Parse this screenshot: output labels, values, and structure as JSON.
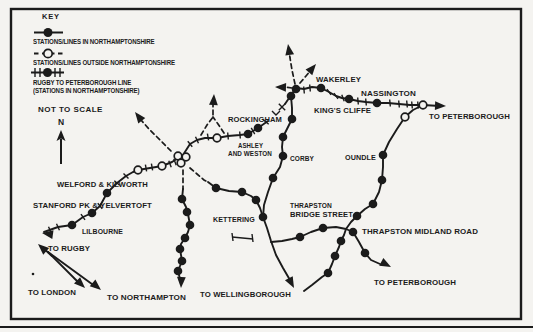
{
  "colors": {
    "ink": "#1b1b1b",
    "paper": "#f4f3f0"
  },
  "key": {
    "title": "KEY",
    "items": [
      {
        "symbol": "filled-station-on-solid-line",
        "label": "STATIONS/LINES IN NORTHAMPTONSHIRE"
      },
      {
        "symbol": "open-station-on-dashed-line",
        "label": "STATIONS/LINES OUTSIDE NORTHAMPTONSHIRE"
      },
      {
        "symbol": "filled-station-on-cross-ticked-line",
        "label": "RUGBY TO PETERBOROUGH LINE",
        "label2": "(STATIONS IN NORTHAMPTONSHIRE)"
      }
    ],
    "not_to_scale": "NOT TO SCALE",
    "north_label": "N"
  },
  "map": {
    "frame": {
      "x": 11,
      "y": 9,
      "w": 510,
      "h": 310,
      "stroke_w": 2.4
    },
    "page_bottom_line": {
      "y": 327
    },
    "labels": [
      {
        "id": "wakerley",
        "text": "WAKERLEY",
        "x": 316,
        "y": 82,
        "w": 45
      },
      {
        "id": "kings-cliffe",
        "text": "KING'S CLIFFE",
        "x": 314,
        "y": 113,
        "w": 57
      },
      {
        "id": "nassington",
        "text": "NASSINGTON",
        "x": 361,
        "y": 96,
        "w": 55
      },
      {
        "id": "to-peterborough-top",
        "text": "TO PETERBOROUGH",
        "x": 429,
        "y": 119,
        "w": 81
      },
      {
        "id": "rockingham",
        "text": "ROCKINGHAM",
        "x": 228,
        "y": 122,
        "w": 54
      },
      {
        "id": "ashley-line1",
        "text": "ASHLEY",
        "x": 238,
        "y": 148,
        "w": 25
      },
      {
        "id": "ashley-line2",
        "text": "AND WESTON",
        "x": 228,
        "y": 156,
        "w": 44
      },
      {
        "id": "corby",
        "text": "CORBY",
        "x": 290,
        "y": 161,
        "w": 24
      },
      {
        "id": "oundle",
        "text": "OUNDLE",
        "x": 345,
        "y": 160,
        "w": 31
      },
      {
        "id": "kettering",
        "text": "KETTERING",
        "x": 213,
        "y": 222,
        "w": 42
      },
      {
        "id": "thrapston-bs-line1",
        "text": "THRAPSTON",
        "x": 290,
        "y": 208,
        "w": 42
      },
      {
        "id": "thrapston-bs-line2",
        "text": "BRIDGE STREET",
        "x": 290,
        "y": 217,
        "w": 63
      },
      {
        "id": "thrapston-midland",
        "text": "THRAPSTON MIDLAND ROAD",
        "x": 362,
        "y": 234,
        "w": 116
      },
      {
        "id": "to-peterborough-bottom",
        "text": "TO PETERBOROUGH",
        "x": 374,
        "y": 285,
        "w": 82
      },
      {
        "id": "to-wellingborough",
        "text": "TO WELLINGBOROUGH",
        "x": 200,
        "y": 297,
        "w": 91
      },
      {
        "id": "to-northampton",
        "text": "TO NORTHAMPTON",
        "x": 107,
        "y": 300,
        "w": 79
      },
      {
        "id": "to-london",
        "text": "TO LONDON",
        "x": 28,
        "y": 295,
        "w": 48
      },
      {
        "id": "to-rugby",
        "text": "TO RUGBY",
        "x": 48,
        "y": 251,
        "w": 42
      },
      {
        "id": "lilbourne",
        "text": "LILBOURNE",
        "x": 82,
        "y": 234,
        "w": 41
      },
      {
        "id": "stanford-pk",
        "text": "STANFORD PK & YELVERTOFT",
        "x": 33,
        "y": 208,
        "w": 119
      },
      {
        "id": "welford",
        "text": "WELFORD & KILWORTH",
        "x": 57,
        "y": 187,
        "w": 91
      }
    ],
    "solid_paths": [
      [
        [
          44,
          232
        ],
        [
          58,
          227
        ],
        [
          72,
          225
        ],
        [
          83,
          217
        ],
        [
          92,
          213
        ],
        [
          100,
          206
        ],
        [
          107,
          193
        ],
        [
          117,
          183
        ],
        [
          126,
          176
        ],
        [
          133,
          172
        ],
        [
          138,
          170
        ],
        [
          150,
          168
        ],
        [
          162,
          166
        ],
        [
          172,
          162
        ],
        [
          178,
          158
        ]
      ],
      [
        [
          183,
          155
        ],
        [
          190,
          144
        ],
        [
          197,
          140
        ],
        [
          205,
          138
        ],
        [
          217,
          138
        ],
        [
          228,
          136
        ],
        [
          240,
          135
        ],
        [
          248,
          134
        ],
        [
          253,
          131
        ],
        [
          258,
          128
        ],
        [
          268,
          121
        ]
      ],
      [
        [
          285,
          104
        ],
        [
          296,
          88
        ]
      ],
      [
        [
          296,
          88
        ],
        [
          304,
          89
        ],
        [
          312,
          87
        ],
        [
          321,
          88
        ],
        [
          329,
          92
        ],
        [
          336,
          96
        ],
        [
          342,
          98
        ],
        [
          349,
          99
        ],
        [
          358,
          101
        ],
        [
          366,
          102
        ],
        [
          377,
          103
        ],
        [
          388,
          103
        ],
        [
          399,
          104
        ],
        [
          410,
          105
        ],
        [
          423,
          105
        ],
        [
          440,
          106
        ]
      ],
      [
        [
          296,
          88
        ],
        [
          291,
          96
        ],
        [
          292,
          108
        ],
        [
          292,
          119
        ],
        [
          287,
          129
        ],
        [
          283,
          137
        ],
        [
          282,
          147
        ],
        [
          283,
          156
        ],
        [
          280,
          167
        ],
        [
          273,
          178
        ],
        [
          268,
          192
        ],
        [
          264,
          205
        ],
        [
          263,
          217
        ]
      ],
      [
        [
          208,
          182
        ],
        [
          216,
          188
        ],
        [
          229,
          191
        ],
        [
          242,
          192
        ],
        [
          251,
          196
        ],
        [
          256,
          200
        ],
        [
          260,
          208
        ],
        [
          263,
          217
        ]
      ],
      [
        [
          263,
          217
        ],
        [
          267,
          228
        ],
        [
          271,
          241
        ],
        [
          276,
          255
        ],
        [
          283,
          268
        ],
        [
          290,
          280
        ]
      ],
      [
        [
          271,
          242
        ],
        [
          282,
          241
        ],
        [
          292,
          239
        ],
        [
          300,
          237
        ],
        [
          311,
          232
        ],
        [
          323,
          228
        ],
        [
          336,
          227
        ],
        [
          346,
          229
        ],
        [
          353,
          232
        ],
        [
          359,
          242
        ],
        [
          365,
          253
        ],
        [
          371,
          260
        ],
        [
          380,
          264
        ]
      ],
      [
        [
          304,
          291
        ],
        [
          312,
          285
        ],
        [
          322,
          277
        ],
        [
          328,
          273
        ],
        [
          332,
          264
        ],
        [
          335,
          256
        ],
        [
          339,
          247
        ],
        [
          341,
          241
        ],
        [
          344,
          235
        ],
        [
          346,
          229
        ],
        [
          351,
          222
        ],
        [
          357,
          216
        ],
        [
          365,
          209
        ],
        [
          373,
          204
        ],
        [
          379,
          192
        ],
        [
          382,
          180
        ],
        [
          383,
          167
        ],
        [
          383,
          155
        ],
        [
          389,
          142
        ],
        [
          397,
          129
        ],
        [
          405,
          117
        ],
        [
          413,
          110
        ],
        [
          421,
          106
        ]
      ],
      [
        [
          183,
          189
        ],
        [
          182,
          199
        ],
        [
          186,
          207
        ],
        [
          188,
          214
        ],
        [
          190,
          225
        ],
        [
          188,
          232
        ],
        [
          185,
          238
        ],
        [
          181,
          244
        ],
        [
          180,
          249
        ],
        [
          181,
          255
        ],
        [
          182,
          261
        ],
        [
          180,
          266
        ],
        [
          178,
          271
        ],
        [
          180,
          279
        ]
      ],
      [
        [
          48,
          252
        ],
        [
          80,
          284
        ]
      ],
      [
        [
          48,
          252
        ],
        [
          96,
          287
        ]
      ],
      [
        [
          52,
          256
        ],
        [
          42,
          247
        ]
      ]
    ],
    "dashed_paths": [
      [
        [
          171,
          151
        ],
        [
          160,
          140
        ],
        [
          149,
          129
        ],
        [
          141,
          120
        ]
      ],
      [
        [
          183,
          170
        ],
        [
          183,
          180
        ],
        [
          183,
          189
        ]
      ],
      [
        [
          190,
          168
        ],
        [
          197,
          174
        ],
        [
          204,
          180
        ],
        [
          208,
          182
        ]
      ],
      [
        [
          295,
          84
        ],
        [
          292,
          70
        ],
        [
          290,
          58
        ],
        [
          289,
          50
        ]
      ],
      [
        [
          300,
          83
        ],
        [
          306,
          76
        ],
        [
          311,
          70
        ]
      ],
      [
        [
          292,
          88
        ],
        [
          284,
          87
        ],
        [
          279,
          87
        ]
      ],
      [
        [
          201,
          135
        ],
        [
          207,
          125
        ],
        [
          213,
          117
        ],
        [
          213,
          101
        ]
      ],
      [
        [
          224,
          133
        ],
        [
          218,
          124
        ],
        [
          213,
          117
        ]
      ]
    ],
    "ticks": [
      [
        50,
        230,
        65
      ],
      [
        58,
        227,
        65
      ],
      [
        83,
        217,
        55
      ],
      [
        100,
        206,
        50
      ],
      [
        117,
        183,
        40
      ],
      [
        126,
        176,
        45
      ],
      [
        146,
        168,
        80
      ],
      [
        152,
        167,
        80
      ],
      [
        170,
        164,
        70
      ],
      [
        175,
        162,
        70
      ],
      [
        190,
        144,
        50
      ],
      [
        197,
        140,
        65
      ],
      [
        208,
        137,
        80
      ],
      [
        228,
        136,
        85
      ],
      [
        240,
        135,
        85
      ],
      [
        253,
        131,
        60
      ],
      [
        266,
        122,
        40
      ],
      [
        304,
        90,
        85
      ],
      [
        310,
        88,
        85
      ],
      [
        329,
        92,
        55
      ],
      [
        336,
        96,
        55
      ],
      [
        343,
        98,
        70
      ],
      [
        358,
        101,
        85
      ],
      [
        366,
        102,
        85
      ],
      [
        390,
        103,
        85
      ],
      [
        399,
        104,
        85
      ],
      [
        407,
        104,
        85
      ],
      [
        412,
        105,
        85
      ],
      [
        418,
        105,
        85
      ]
    ],
    "stations_filled": [
      [
        72,
        225
      ],
      [
        92,
        213
      ],
      [
        107,
        193
      ],
      [
        248,
        134
      ],
      [
        258,
        128
      ],
      [
        296,
        89
      ],
      [
        321,
        88
      ],
      [
        349,
        99
      ],
      [
        377,
        103
      ],
      [
        291,
        96
      ],
      [
        292,
        119
      ],
      [
        283,
        137
      ],
      [
        283,
        156
      ],
      [
        273,
        178
      ],
      [
        263,
        217
      ],
      [
        216,
        188
      ],
      [
        242,
        192
      ],
      [
        256,
        200
      ],
      [
        182,
        199
      ],
      [
        187,
        212
      ],
      [
        190,
        225
      ],
      [
        185,
        238
      ],
      [
        180,
        249
      ],
      [
        182,
        261
      ],
      [
        178,
        271
      ],
      [
        300,
        237
      ],
      [
        323,
        228
      ],
      [
        353,
        232
      ],
      [
        365,
        253
      ],
      [
        357,
        216
      ],
      [
        373,
        204
      ],
      [
        382,
        180
      ],
      [
        383,
        155
      ],
      [
        341,
        241
      ],
      [
        335,
        256
      ],
      [
        328,
        273
      ]
    ],
    "stations_open": [
      [
        138,
        170
      ],
      [
        162,
        166
      ],
      [
        178,
        156
      ],
      [
        186,
        157
      ],
      [
        181,
        163
      ],
      [
        217,
        138
      ],
      [
        405,
        117
      ],
      [
        423,
        105
      ]
    ],
    "arrows": [
      [
        42,
        233,
        188
      ],
      [
        38,
        244,
        222
      ],
      [
        85,
        288,
        44
      ],
      [
        101,
        290,
        40
      ],
      [
        181,
        288,
        92
      ],
      [
        294,
        288,
        62
      ],
      [
        391,
        267,
        28
      ],
      [
        446,
        106,
        2
      ],
      [
        135,
        112,
        232
      ],
      [
        288,
        44,
        261
      ],
      [
        316,
        64,
        310
      ],
      [
        275,
        87,
        182
      ],
      [
        214,
        94,
        273
      ]
    ],
    "marks": [
      {
        "type": "x",
        "x": 282,
        "y": 107
      },
      {
        "type": "v",
        "x": 276,
        "y": 113
      },
      {
        "type": "seg",
        "pts": [
          [
            232,
            233
          ],
          [
            233,
            241
          ]
        ]
      },
      {
        "type": "seg",
        "pts": [
          [
            232,
            237
          ],
          [
            253,
            239
          ]
        ]
      },
      {
        "type": "seg",
        "pts": [
          [
            252,
            234
          ],
          [
            253,
            242
          ]
        ]
      },
      {
        "type": "dot",
        "x": 33,
        "y": 274
      }
    ]
  }
}
